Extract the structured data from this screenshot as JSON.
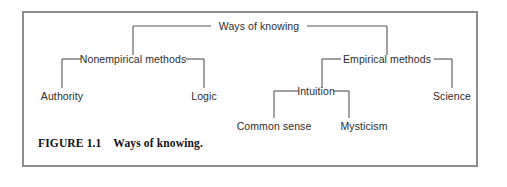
{
  "figure": {
    "caption_number": "FIGURE 1.1",
    "caption_title": "Ways of knowing.",
    "caption_full": "FIGURE 1.1    Ways of knowing.",
    "border_color": "#8d8d8f",
    "background_color": "#ffffff",
    "line_color": "#555555",
    "text_color": "#2b2b2b"
  },
  "diagram": {
    "type": "tree",
    "orientation": "top-down",
    "root": "Ways of knowing",
    "nodes": {
      "root": {
        "label": "Ways of knowing",
        "level": 0,
        "x": 259,
        "y": 26
      },
      "nonempirical": {
        "label": "Nonempirical methods",
        "level": 1,
        "x": 133,
        "y": 59
      },
      "empirical": {
        "label": "Empirical methods",
        "level": 1,
        "x": 387,
        "y": 59
      },
      "authority": {
        "label": "Authority",
        "level": 2,
        "x": 62,
        "y": 91
      },
      "logic": {
        "label": "Logic",
        "level": 2,
        "x": 204,
        "y": 91
      },
      "intuition": {
        "label": "Intuition",
        "level": 2,
        "x": 322,
        "y": 91
      },
      "science": {
        "label": "Science",
        "level": 2,
        "x": 452,
        "y": 91
      },
      "common_sense": {
        "label": "Common sense",
        "level": 3,
        "x": 274,
        "y": 121
      },
      "mysticism": {
        "label": "Mysticism",
        "level": 3,
        "x": 349,
        "y": 121
      }
    },
    "edges": [
      {
        "from": "root",
        "to": "nonempirical"
      },
      {
        "from": "root",
        "to": "empirical"
      },
      {
        "from": "nonempirical",
        "to": "authority"
      },
      {
        "from": "nonempirical",
        "to": "logic"
      },
      {
        "from": "empirical",
        "to": "intuition"
      },
      {
        "from": "empirical",
        "to": "science"
      },
      {
        "from": "intuition",
        "to": "common_sense"
      },
      {
        "from": "intuition",
        "to": "mysticism"
      }
    ]
  }
}
